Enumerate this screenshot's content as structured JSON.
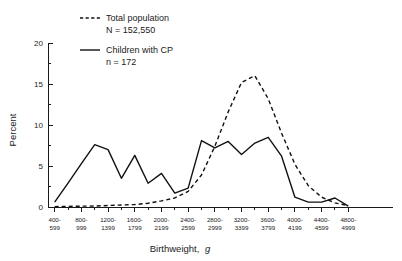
{
  "chart_data": {
    "type": "line",
    "title": "",
    "xlabel": "Birthweight, g",
    "xlabel_plain": "Birthweight,",
    "xlabel_italic": "g",
    "ylabel": "Percent",
    "ylim": [
      0,
      20
    ],
    "xlim": [
      0,
      23
    ],
    "grid": false,
    "legend_position": "top-left",
    "ytick_values": [
      0,
      5,
      10,
      15,
      20
    ],
    "ytick_labels": [
      "0",
      "5",
      "10",
      "15",
      "20"
    ],
    "ytick_minor_step": 2.5,
    "categories": [
      "400-599",
      "600-799",
      "800-999",
      "1000-1199",
      "1200-1399",
      "1400-1599",
      "1600-1799",
      "1800-1999",
      "2000-2199",
      "2200-2399",
      "2400-2599",
      "2600-2799",
      "2800-2999",
      "3000-3199",
      "3200-3399",
      "3400-3599",
      "3600-3799",
      "3800-3999",
      "4000-4199",
      "4200-4399",
      "4400-4599",
      "4600-4799",
      "4800-4999"
    ],
    "xtick_labels_shown": [
      {
        "index": 0,
        "top": "400-",
        "bottom": "599"
      },
      {
        "index": 2,
        "top": "800-",
        "bottom": "999"
      },
      {
        "index": 4,
        "top": "1200-",
        "bottom": "1399"
      },
      {
        "index": 6,
        "top": "1600-",
        "bottom": "1799"
      },
      {
        "index": 8,
        "top": "2000-",
        "bottom": "2199"
      },
      {
        "index": 10,
        "top": "2400-",
        "bottom": "2599"
      },
      {
        "index": 12,
        "top": "2800-",
        "bottom": "2999"
      },
      {
        "index": 14,
        "top": "3200-",
        "bottom": "3399"
      },
      {
        "index": 16,
        "top": "3600-",
        "bottom": "3799"
      },
      {
        "index": 18,
        "top": "4000-",
        "bottom": "4199"
      },
      {
        "index": 20,
        "top": "4400-",
        "bottom": "4599"
      },
      {
        "index": 22,
        "top": "4800-",
        "bottom": "4999"
      }
    ],
    "series": [
      {
        "name": "Total population",
        "sublabel": "N = 152,550",
        "style": "dashed",
        "color": "#111111",
        "values": [
          0.05,
          0.08,
          0.1,
          0.12,
          0.18,
          0.25,
          0.3,
          0.45,
          0.75,
          1.1,
          1.9,
          3.9,
          7.4,
          11.6,
          15.2,
          16.0,
          13.2,
          9.0,
          5.2,
          2.6,
          1.2,
          0.5,
          0.15
        ]
      },
      {
        "name": "Children with CP",
        "sublabel": "n = 172",
        "style": "solid",
        "color": "#111111",
        "values": [
          0.6,
          2.9,
          5.3,
          7.6,
          7.0,
          3.5,
          6.3,
          2.9,
          4.1,
          1.7,
          2.3,
          8.1,
          7.2,
          8.0,
          6.4,
          7.8,
          8.5,
          6.2,
          1.2,
          0.6,
          0.6,
          1.1,
          0.1
        ]
      }
    ],
    "legend": [
      {
        "label": "Total population",
        "sublabel": "N = 152,550",
        "style": "dashed"
      },
      {
        "label": "Children with CP",
        "sublabel": "n = 172",
        "style": "solid"
      }
    ]
  }
}
